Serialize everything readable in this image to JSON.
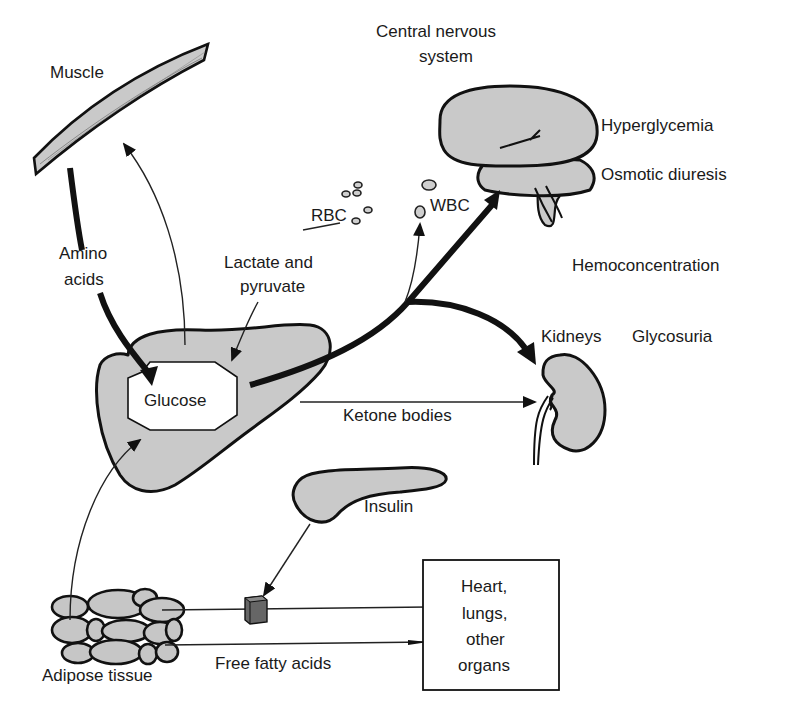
{
  "diagram": {
    "colors": {
      "organ_fill": "#c9c9c9",
      "stroke": "#111111",
      "background": "#ffffff",
      "inhibitor_block": "#666666"
    },
    "labels": {
      "muscle": "Muscle",
      "cns_line1": "Central nervous",
      "cns_line2": "system",
      "hyperglycemia": "Hyperglycemia",
      "osmotic_diuresis": "Osmotic diuresis",
      "rbc": "RBC",
      "wbc": "WBC",
      "amino_line1": "Amino",
      "amino_line2": "acids",
      "lactate_line1": "Lactate and",
      "lactate_line2": "pyruvate",
      "hemoconcentration": "Hemoconcentration",
      "kidneys": "Kidneys",
      "glycosuria": "Glycosuria",
      "glucose": "Glucose",
      "ketone_bodies": "Ketone bodies",
      "insulin": "Insulin",
      "organs_line1": "Heart,",
      "organs_line2": "lungs,",
      "organs_line3": "other",
      "organs_line4": "organs",
      "adipose": "Adipose tissue",
      "ffa": "Free fatty acids"
    },
    "nodes": [
      {
        "id": "muscle",
        "label": "Muscle"
      },
      {
        "id": "liver",
        "label": "Glucose"
      },
      {
        "id": "brain",
        "label": "Central nervous system"
      },
      {
        "id": "kidney",
        "label": "Kidneys"
      },
      {
        "id": "pancreas",
        "label": "Insulin"
      },
      {
        "id": "adipose",
        "label": "Adipose tissue"
      },
      {
        "id": "organs",
        "label": "Heart, lungs, other organs"
      },
      {
        "id": "rbc",
        "label": "RBC"
      },
      {
        "id": "wbc",
        "label": "WBC"
      }
    ],
    "edges": [
      {
        "from": "muscle",
        "to": "liver",
        "label": "Amino acids",
        "weight": "thick"
      },
      {
        "from": "liver",
        "to": "muscle",
        "label": "",
        "weight": "thin"
      },
      {
        "from": "rbc",
        "to": "liver",
        "label": "Lactate and pyruvate",
        "weight": "thin"
      },
      {
        "from": "liver",
        "to": "brain",
        "label": "",
        "weight": "thick"
      },
      {
        "from": "liver",
        "to": "wbc",
        "label": "",
        "weight": "thin"
      },
      {
        "from": "liver",
        "to": "kidney",
        "label": "",
        "weight": "thick"
      },
      {
        "from": "liver",
        "to": "kidney",
        "label": "Ketone bodies",
        "weight": "thin"
      },
      {
        "from": "adipose",
        "to": "liver",
        "label": "",
        "weight": "thin"
      },
      {
        "from": "pancreas",
        "to": "adipose-ffa-pathway",
        "label": "Insulin (inhibits)",
        "weight": "thin"
      },
      {
        "from": "adipose",
        "to": "organs",
        "label": "Free fatty acids",
        "weight": "thin"
      }
    ]
  }
}
